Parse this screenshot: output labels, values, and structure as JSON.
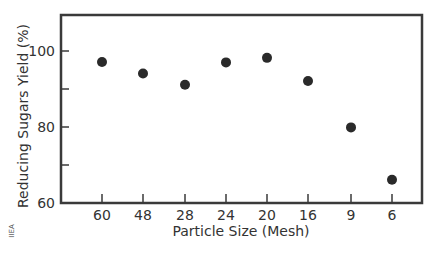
{
  "chart_data": {
    "type": "scatter",
    "title": "",
    "xlabel": "Particle Size (Mesh)",
    "ylabel": "Reducing Sugars Yield (%)",
    "categories": [
      "60",
      "48",
      "28",
      "24",
      "20",
      "16",
      "9",
      "6"
    ],
    "series": [
      {
        "name": "Reducing Sugars Yield",
        "values": [
          97.1,
          94.1,
          91.1,
          97.0,
          98.2,
          92.1,
          79.9,
          66.1
        ]
      }
    ],
    "ylim": [
      60,
      111
    ],
    "yticks": [
      60,
      70,
      80,
      90,
      100
    ],
    "ytick_labels": [
      "60",
      "",
      "80",
      "",
      "100"
    ],
    "grid": false,
    "legend": null,
    "marker_color": "#2a2a2a",
    "axis_color": "#3a3a3a"
  },
  "credit": "IIEA"
}
